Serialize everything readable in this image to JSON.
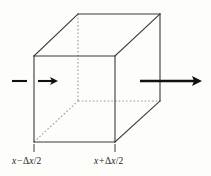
{
  "figure": {
    "type": "geometry-diagram",
    "background_color": "#fdfdfa",
    "line_color": "#3a3a3a",
    "hidden_line_color": "#9a9a9a",
    "arrow_color": "#111111",
    "cube": {
      "front_face": {
        "top_left": [
          34,
          56
        ],
        "top_right": [
          115,
          56
        ],
        "bottom_right": [
          115,
          142
        ],
        "bottom_left": [
          34,
          142
        ]
      },
      "back_face": {
        "top_left": [
          78,
          14
        ],
        "top_right": [
          160,
          14
        ],
        "bottom_right": [
          160,
          101
        ],
        "bottom_left": [
          78,
          101
        ]
      },
      "hidden_edges": [
        "back-vertical-left",
        "back-bottom-left",
        "back-bottom-right"
      ]
    },
    "arrows": [
      {
        "name": "inflow-arrow",
        "direction": "right",
        "tail_x": 12,
        "head_x": 58,
        "y": 81,
        "has_gap_at_face": true
      },
      {
        "name": "outflow-arrow",
        "direction": "right",
        "tail_x": 140,
        "head_x": 202,
        "y": 81,
        "has_gap_at_face": false
      }
    ],
    "ticks": [
      {
        "name": "tick-left",
        "x": 34,
        "y_top": 144,
        "y_bottom": 152
      },
      {
        "name": "tick-right",
        "x": 115,
        "y_top": 144,
        "y_bottom": 152
      }
    ],
    "labels": {
      "left": {
        "variable": "x",
        "operator": "−",
        "delta": "Δ",
        "delta_variable": "x",
        "divisor": "/2",
        "full_text": "x − Δx/2"
      },
      "right": {
        "variable": "x",
        "operator": "+",
        "delta": "Δ",
        "delta_variable": "x",
        "divisor": "/2",
        "full_text": "x + Δx/2"
      }
    }
  }
}
